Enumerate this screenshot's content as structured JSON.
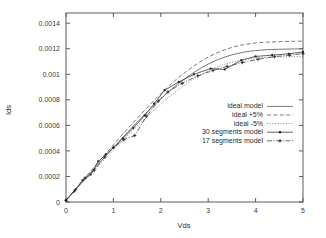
{
  "chart_data": {
    "type": "line",
    "title": "",
    "xlabel": "Vds",
    "ylabel": "Ids",
    "xlim": [
      0,
      5
    ],
    "ylim": [
      0,
      0.00148
    ],
    "grid": false,
    "legend_position": "center-right",
    "xticks": [
      0,
      1,
      2,
      3,
      4,
      5
    ],
    "xtick_labels": [
      "0",
      "1",
      "2",
      "3",
      "4",
      "5"
    ],
    "yticks": [
      0,
      0.0002,
      0.0004,
      0.0006,
      0.0008,
      0.001,
      0.0012,
      0.0014
    ],
    "ytick_labels": [
      "0",
      "0.0002",
      "0.0004",
      "0.0006",
      "0.0008",
      "0.001",
      "0.0012",
      "0.0014"
    ],
    "series": [
      {
        "name": "ideal model",
        "style": "solid",
        "marker": "none",
        "x": [
          0,
          0.25,
          0.5,
          0.75,
          1,
          1.25,
          1.5,
          1.75,
          2,
          2.25,
          2.5,
          2.75,
          3,
          3.25,
          3.5,
          3.75,
          4,
          4.25,
          4.5,
          4.75,
          5
        ],
        "y": [
          1.5e-05,
          0.000118,
          0.000222,
          0.000325,
          0.000427,
          0.000527,
          0.000624,
          0.000718,
          0.000808,
          0.00089,
          0.000963,
          0.001027,
          0.00108,
          0.001122,
          0.001152,
          0.001173,
          0.001186,
          0.001193,
          0.001196,
          0.001198,
          0.0012
        ]
      },
      {
        "name": "ideal +5%",
        "style": "dashed",
        "marker": "none",
        "x": [
          0,
          0.25,
          0.5,
          0.75,
          1,
          1.25,
          1.5,
          1.75,
          2,
          2.25,
          2.5,
          2.75,
          3,
          3.25,
          3.5,
          3.75,
          4,
          4.25,
          4.5,
          4.75,
          5
        ],
        "y": [
          1.6e-05,
          0.000124,
          0.000233,
          0.000341,
          0.000448,
          0.000553,
          0.000655,
          0.000754,
          0.000848,
          0.000935,
          0.001011,
          0.001078,
          0.001134,
          0.001178,
          0.00121,
          0.001232,
          0.001245,
          0.001252,
          0.001256,
          0.001258,
          0.00126
        ]
      },
      {
        "name": "ideal -5%",
        "style": "dotted",
        "marker": "none",
        "x": [
          0,
          0.25,
          0.5,
          0.75,
          1,
          1.25,
          1.5,
          1.75,
          2,
          2.25,
          2.5,
          2.75,
          3,
          3.25,
          3.5,
          3.75,
          4,
          4.25,
          4.5,
          4.75,
          5
        ],
        "y": [
          1.4e-05,
          0.000112,
          0.000211,
          0.000309,
          0.000406,
          0.000501,
          0.000593,
          0.000682,
          0.000768,
          0.000846,
          0.000915,
          0.000976,
          0.001026,
          0.001066,
          0.001095,
          0.001114,
          0.001127,
          0.001133,
          0.001136,
          0.001138,
          0.00114
        ]
      },
      {
        "name": "30 segments model",
        "style": "solid",
        "marker": "dot",
        "x": [
          0,
          0.17,
          0.35,
          0.52,
          0.68,
          0.84,
          1.0,
          1.2,
          1.42,
          1.66,
          1.86,
          2.08,
          2.38,
          2.7,
          3.05,
          3.35,
          3.7,
          4.0,
          4.35,
          4.7,
          5.0
        ],
        "y": [
          1.2e-05,
          8.2e-05,
          0.00017,
          0.000215,
          0.000318,
          0.000373,
          0.000425,
          0.000498,
          0.00058,
          0.000678,
          0.00077,
          0.000875,
          0.00094,
          0.001,
          0.001045,
          0.001038,
          0.00111,
          0.00114,
          0.00115,
          0.00116,
          0.001175
        ]
      },
      {
        "name": "17 segments model",
        "style": "dash-dot",
        "marker": "plus",
        "x": [
          0,
          0.2,
          0.4,
          0.6,
          0.82,
          1.0,
          1.22,
          1.45,
          1.7,
          1.95,
          2.15,
          2.45,
          2.78,
          3.1,
          3.4,
          3.72,
          4.05,
          4.4,
          4.72,
          5.0
        ],
        "y": [
          1.3e-05,
          9.6e-05,
          0.000188,
          0.00025,
          0.000352,
          0.000427,
          0.000488,
          0.00052,
          0.000672,
          0.00079,
          0.000862,
          0.00093,
          0.000988,
          0.00103,
          0.001062,
          0.001092,
          0.001118,
          0.001138,
          0.00115,
          0.001162
        ]
      }
    ]
  },
  "legend": {
    "items": [
      {
        "label": "ideal model",
        "style": "solid"
      },
      {
        "label": "ideal +5%",
        "style": "dashed"
      },
      {
        "label": "ideal -5%",
        "style": "dotted"
      },
      {
        "label": "30 segments model",
        "style": "solid-dot"
      },
      {
        "label": "17 segments model",
        "style": "dash-plus"
      }
    ]
  },
  "colors": {
    "axis": "#5a5a5a",
    "text": "#2c2c2c",
    "curve": "#555555",
    "background": "#ffffff"
  }
}
